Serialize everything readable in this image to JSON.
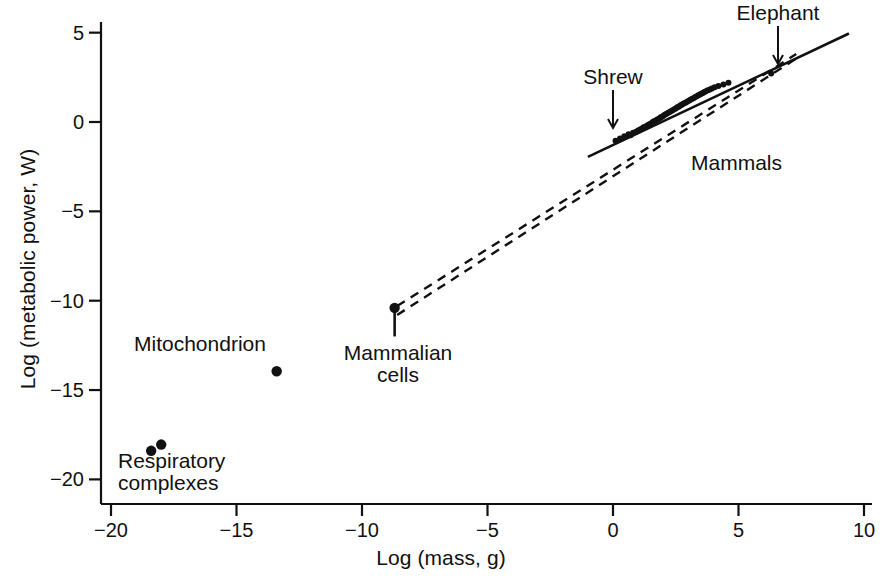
{
  "figure": {
    "background": "#ffffff",
    "ink_color": "#111111"
  },
  "axes": {
    "x_title": "Log (mass, g)",
    "y_title": "Log (metabolic power, W)",
    "x_ticks": [
      "−20",
      "−15",
      "−10",
      "−5",
      "0",
      "5",
      "10"
    ],
    "y_ticks": [
      "5",
      "0",
      "−5",
      "−10",
      "−15",
      "−20"
    ]
  },
  "annotations": {
    "shrew": "Shrew",
    "elephant": "Elephant",
    "mammals": "Mammals",
    "mitochondrion": "Mitochondrion",
    "respiratory_line1": "Respiratory",
    "respiratory_line2": "complexes",
    "mammalian_line1": "Mammalian",
    "mammalian_line2": "cells"
  },
  "chart_data": {
    "type": "scatter",
    "title": "",
    "xlabel": "Log (mass, g)",
    "ylabel": "Log (metabolic power, W)",
    "xlim": [
      -20,
      10
    ],
    "ylim": [
      -22,
      6
    ],
    "xticks": [
      -20,
      -15,
      -10,
      -5,
      0,
      5,
      10
    ],
    "yticks": [
      5,
      0,
      -5,
      -10,
      -15,
      -20
    ],
    "grid": false,
    "legend": false,
    "series": [
      {
        "name": "Respiratory complexes",
        "marker": "filled-circle",
        "points": [
          [
            -18.4,
            -18.4
          ],
          [
            -18.0,
            -18.05
          ]
        ]
      },
      {
        "name": "Mitochondrion",
        "marker": "filled-circle",
        "points": [
          [
            -13.4,
            -13.95
          ]
        ]
      },
      {
        "name": "Mammalian cells",
        "marker": "filled-circle",
        "points": [
          [
            -8.7,
            -10.4
          ]
        ],
        "error_bar": {
          "x": -8.7,
          "y_low": -12.0,
          "y_high": -10.4
        }
      },
      {
        "name": "Mammals",
        "marker": "filled-circle",
        "points": [
          [
            0.1,
            -1.05
          ],
          [
            0.28,
            -0.92
          ],
          [
            0.45,
            -0.8
          ],
          [
            0.62,
            -0.68
          ],
          [
            0.7,
            -0.74
          ],
          [
            0.8,
            -0.6
          ],
          [
            0.92,
            -0.55
          ],
          [
            1.0,
            -0.48
          ],
          [
            1.08,
            -0.42
          ],
          [
            1.15,
            -0.36
          ],
          [
            1.22,
            -0.3
          ],
          [
            1.3,
            -0.25
          ],
          [
            1.38,
            -0.18
          ],
          [
            1.45,
            -0.12
          ],
          [
            1.52,
            -0.08
          ],
          [
            1.58,
            0.0
          ],
          [
            1.65,
            0.05
          ],
          [
            1.72,
            0.1
          ],
          [
            1.78,
            0.16
          ],
          [
            1.85,
            0.2
          ],
          [
            1.9,
            0.26
          ],
          [
            1.96,
            0.3
          ],
          [
            2.02,
            0.36
          ],
          [
            2.08,
            0.42
          ],
          [
            2.14,
            0.46
          ],
          [
            2.2,
            0.52
          ],
          [
            2.26,
            0.56
          ],
          [
            2.32,
            0.62
          ],
          [
            2.38,
            0.66
          ],
          [
            2.44,
            0.72
          ],
          [
            2.5,
            0.76
          ],
          [
            2.56,
            0.82
          ],
          [
            2.62,
            0.86
          ],
          [
            2.68,
            0.92
          ],
          [
            2.74,
            0.96
          ],
          [
            2.8,
            1.02
          ],
          [
            2.86,
            1.06
          ],
          [
            2.92,
            1.1
          ],
          [
            2.98,
            1.16
          ],
          [
            3.04,
            1.2
          ],
          [
            3.1,
            1.26
          ],
          [
            3.16,
            1.3
          ],
          [
            3.22,
            1.34
          ],
          [
            3.28,
            1.4
          ],
          [
            3.34,
            1.44
          ],
          [
            3.4,
            1.5
          ],
          [
            3.46,
            1.54
          ],
          [
            3.52,
            1.58
          ],
          [
            3.58,
            1.62
          ],
          [
            3.64,
            1.68
          ],
          [
            3.7,
            1.72
          ],
          [
            3.78,
            1.78
          ],
          [
            3.86,
            1.82
          ],
          [
            3.94,
            1.88
          ],
          [
            4.05,
            1.94
          ],
          [
            4.2,
            2.02
          ],
          [
            4.4,
            2.1
          ],
          [
            4.6,
            2.2
          ],
          [
            6.3,
            2.72
          ]
        ]
      }
    ],
    "fit_lines": [
      {
        "name": "Mammal regression (solid)",
        "style": "solid",
        "x_start": -1.0,
        "y_start": -1.95,
        "x_end": 9.4,
        "y_end": 4.95
      },
      {
        "name": "Upper allometric extrapolation (dashed)",
        "style": "dashed",
        "x_start": -8.6,
        "y_start": -10.3,
        "x_end": 7.3,
        "y_end": 3.8
      },
      {
        "name": "Lower allometric extrapolation (dashed)",
        "style": "dashed",
        "x_start": -8.6,
        "y_start": -10.8,
        "x_end": 7.3,
        "y_end": 3.55
      }
    ],
    "callouts": [
      {
        "label": "Shrew",
        "points_to": [
          0.55,
          -0.75
        ]
      },
      {
        "label": "Elephant",
        "points_to": [
          6.3,
          2.72
        ]
      },
      {
        "label": "Mammals",
        "points_to": null
      },
      {
        "label": "Mitochondrion",
        "points_to": [
          -13.4,
          -13.95
        ]
      },
      {
        "label": "Respiratory complexes",
        "points_to": [
          -18.2,
          -18.2
        ]
      },
      {
        "label": "Mammalian cells",
        "points_to": [
          -8.7,
          -10.4
        ]
      }
    ]
  }
}
